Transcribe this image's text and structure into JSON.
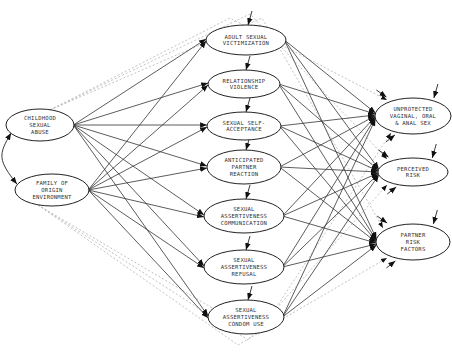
{
  "diagram": {
    "type": "path-model",
    "colors": {
      "line": "#333333",
      "dashed": "#bbbbbb",
      "node_fill": "#ffffff",
      "node_stroke": "#222222",
      "text": "#333333"
    },
    "exogenous": [
      {
        "id": "csa",
        "lines": [
          "CHILDHOOD",
          "SEXUAL",
          "ABUSE"
        ],
        "cx": 40,
        "cy": 125,
        "rx": 34,
        "ry": 16
      },
      {
        "id": "foe",
        "lines": [
          "FAMILY OF",
          "ORIGIN",
          "ENVIRONMENT"
        ],
        "cx": 52,
        "cy": 190,
        "rx": 37,
        "ry": 16
      }
    ],
    "mediators": [
      {
        "id": "asv",
        "lines": [
          "ADULT SEXUAL",
          "VICTIMIZATION"
        ],
        "cx": 246,
        "cy": 40,
        "rx": 40,
        "ry": 15
      },
      {
        "id": "rv",
        "lines": [
          "RELATIONSHIP",
          "VIOLENCE"
        ],
        "cx": 244,
        "cy": 84,
        "rx": 36,
        "ry": 14
      },
      {
        "id": "ssa",
        "lines": [
          "SEXUAL SELF-",
          "ACCEPTANCE"
        ],
        "cx": 244,
        "cy": 126,
        "rx": 37,
        "ry": 14
      },
      {
        "id": "apr",
        "lines": [
          "ANTICIPATED",
          "PARTNER",
          "REACTION"
        ],
        "cx": 244,
        "cy": 167,
        "rx": 37,
        "ry": 17
      },
      {
        "id": "sac",
        "lines": [
          "SEXUAL",
          "ASSERTIVENESS",
          "COMMUNICATION"
        ],
        "cx": 244,
        "cy": 216,
        "rx": 40,
        "ry": 17
      },
      {
        "id": "sar",
        "lines": [
          "SEXUAL",
          "ASSERTIVENESS",
          "REFUSAL"
        ],
        "cx": 244,
        "cy": 267,
        "rx": 40,
        "ry": 17
      },
      {
        "id": "scu",
        "lines": [
          "SEXUAL",
          "ASSERTIVENESS",
          "CONDOM USE"
        ],
        "cx": 246,
        "cy": 317,
        "rx": 38,
        "ry": 17
      }
    ],
    "outcomes": [
      {
        "id": "uvoa",
        "lines": [
          "UNPROTECTED",
          "VAGINAL, ORAL",
          "& ANAL SEX"
        ],
        "cx": 413,
        "cy": 116,
        "rx": 38,
        "ry": 18
      },
      {
        "id": "pr",
        "lines": [
          "PERCEIVED",
          "RISK"
        ],
        "cx": 413,
        "cy": 172,
        "rx": 35,
        "ry": 14
      },
      {
        "id": "prf",
        "lines": [
          "PARTNER",
          "RISK",
          "FACTORS"
        ],
        "cx": 413,
        "cy": 242,
        "rx": 37,
        "ry": 18
      }
    ],
    "paths_description": "Each exogenous variable points to every mediator; each mediator points to every outcome; curved double-headed arrow links the two exogenous variables; dashed lines indicate direct paths from exogenous variables to outcomes; each endogenous variable has a short disturbance arrow."
  }
}
